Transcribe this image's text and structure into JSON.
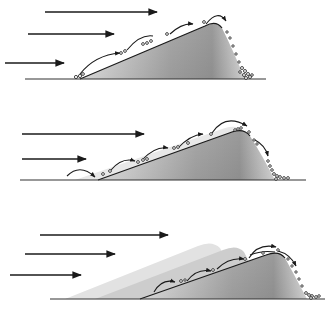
{
  "figure": {
    "title": "",
    "colors": {
      "ink": "#1a1a1a",
      "dune_light": "#e6e6e6",
      "dune_dark": "#8c8c8c",
      "ghost_1": "#d9d9d9",
      "ghost_2": "#c4c4c4",
      "background": "#ffffff"
    },
    "panels": [
      {
        "id": "stage-1",
        "wind_arrows": [
          {
            "x1": 45,
            "x2": 157,
            "y": 12
          },
          {
            "x1": 28,
            "x2": 114,
            "y": 34
          },
          {
            "x1": 5,
            "x2": 64,
            "y": 63
          }
        ],
        "ground": {
          "x1": 25,
          "x2": 266,
          "y": 79
        }
      },
      {
        "id": "stage-2",
        "wind_arrows": [
          {
            "x1": 22,
            "x2": 144,
            "y": 134
          },
          {
            "x1": 22,
            "x2": 86,
            "y": 159
          }
        ],
        "ground": {
          "x1": 20,
          "x2": 306,
          "y": 180
        }
      },
      {
        "id": "stage-3",
        "wind_arrows": [
          {
            "x1": 40,
            "x2": 168,
            "y": 235
          },
          {
            "x1": 25,
            "x2": 115,
            "y": 254
          },
          {
            "x1": 10,
            "x2": 81,
            "y": 275
          }
        ],
        "ground": {
          "x1": 50,
          "x2": 325,
          "y": 299
        }
      }
    ]
  }
}
